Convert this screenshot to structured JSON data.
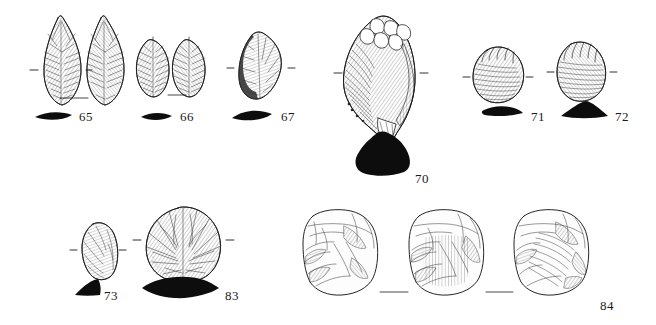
{
  "plate": {
    "type": "archaeological-lithic-illustration-plate",
    "background_color": "#ffffff",
    "ink_color": "#1a1a1a",
    "width": 656,
    "height": 325,
    "description": "Line-drawn plate of flaked stone artefacts with solid black cross-section profiles and numeric catalogue labels"
  },
  "specimens": [
    {
      "number": "65",
      "views": 2,
      "artifact_type": "bifacial leaf point",
      "cross_section": "thin symmetric lens",
      "tick_marks": true,
      "label_x": 79,
      "label_y": 110
    },
    {
      "number": "66",
      "views": 2,
      "artifact_type": "small oval biface",
      "cross_section": "thin symmetric lens",
      "tick_marks": true,
      "label_x": 180,
      "label_y": 110
    },
    {
      "number": "67",
      "views": 1,
      "artifact_type": "sub-triangular retouched flake",
      "cross_section": "asymmetric plano-convex",
      "tick_marks": true,
      "label_x": 281,
      "label_y": 110
    },
    {
      "number": "70",
      "views": 1,
      "artifact_type": "large core / chunk",
      "cross_section": "solid angular block",
      "tick_marks": true,
      "label_x": 415,
      "label_y": 172
    },
    {
      "number": "71",
      "views": 1,
      "artifact_type": "side scraper",
      "cross_section": "low flat plano-convex",
      "tick_marks": true,
      "label_x": 531,
      "label_y": 110
    },
    {
      "number": "72",
      "views": 1,
      "artifact_type": "side scraper",
      "cross_section": "tall triangular",
      "tick_marks": true,
      "label_x": 615,
      "label_y": 110
    },
    {
      "number": "73",
      "views": 1,
      "artifact_type": "small irregular flake",
      "cross_section": "wedge",
      "tick_marks": true,
      "label_x": 104,
      "label_y": 289
    },
    {
      "number": "83",
      "views": 1,
      "artifact_type": "discoidal domed piece",
      "cross_section": "pointed biconvex lens",
      "tick_marks": true,
      "label_x": 225,
      "label_y": 289
    },
    {
      "number": "84",
      "views": 3,
      "artifact_type": "blocky multi-platform core",
      "cross_section": "none",
      "tick_marks": false,
      "label_x": 600,
      "label_y": 299
    }
  ]
}
